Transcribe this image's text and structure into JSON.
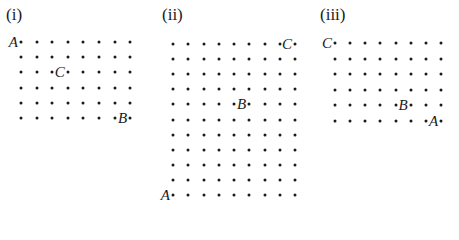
{
  "panels": [
    {
      "label": "(i)",
      "label_pos": [
        6,
        6
      ],
      "cols": 8,
      "rows": 6,
      "origin": [
        21,
        42
      ],
      "dx": 15.6,
      "dy": 15.2,
      "points": [
        {
          "name": "A",
          "col": 0,
          "row": 0
        },
        {
          "name": "C",
          "col": 3,
          "row": 2
        },
        {
          "name": "B",
          "col": 7,
          "row": 5
        }
      ]
    },
    {
      "label": "(ii)",
      "label_pos": [
        162,
        6
      ],
      "cols": 9,
      "rows": 11,
      "origin": [
        173,
        44
      ],
      "dx": 15.25,
      "dy": 15.1,
      "points": [
        {
          "name": "C",
          "col": 8,
          "row": 0
        },
        {
          "name": "B",
          "col": 5,
          "row": 4
        },
        {
          "name": "A",
          "col": 0,
          "row": 10
        }
      ]
    },
    {
      "label": "(iii)",
      "label_pos": [
        320,
        6
      ],
      "cols": 8,
      "rows": 6,
      "origin": [
        335,
        43
      ],
      "dx": 15.15,
      "dy": 15.6,
      "points": [
        {
          "name": "C",
          "col": 0,
          "row": 0
        },
        {
          "name": "B",
          "col": 5,
          "row": 4
        },
        {
          "name": "A",
          "col": 7,
          "row": 5
        }
      ]
    }
  ]
}
